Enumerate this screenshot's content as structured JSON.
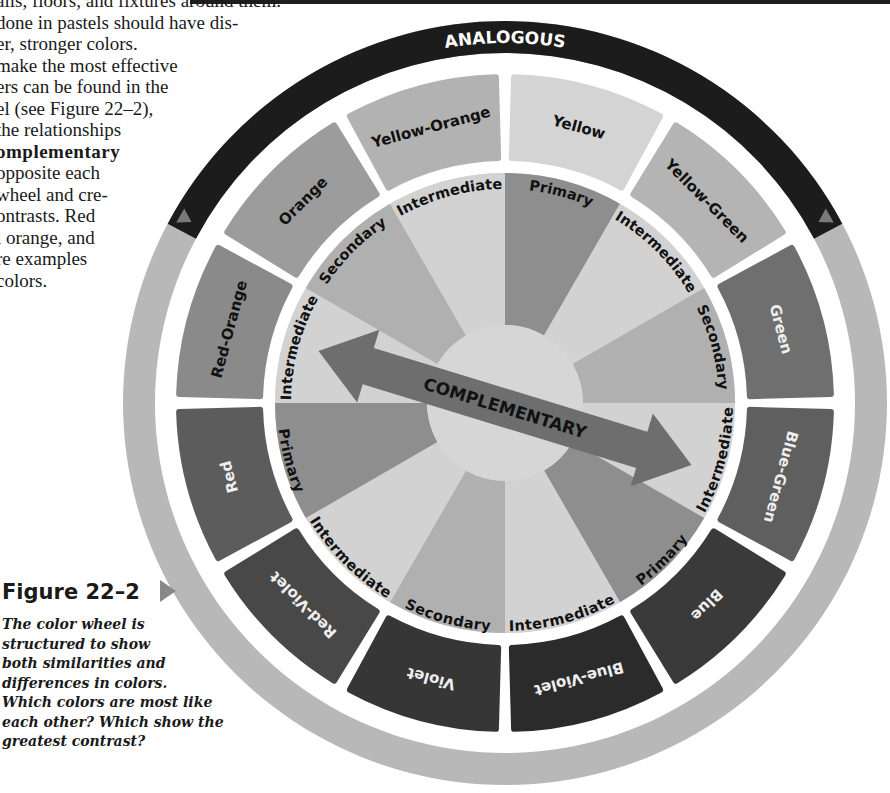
{
  "page": {
    "top_rule_color": "#1e1e1e"
  },
  "body_text": {
    "lines": [
      "alls, floors, and fixtures around them.",
      " done in pastels should have dis-",
      "er, stronger colors.",
      "make the most effective",
      "ers can be found in the",
      "el (see Figure 22–2),",
      "the relationships",
      "omplementary",
      "opposite each",
      "wheel and cre-",
      "ontrasts. Red",
      "l orange, and",
      "re examples",
      "colors."
    ],
    "bold_line_index": 7
  },
  "figure": {
    "label": "Figure 22–2",
    "caption_lines": [
      "The color wheel is",
      "structured to show",
      "both similarities and",
      "differences in colors.",
      "Which colors are most like",
      "each other? Which show the",
      "greatest contrast?"
    ],
    "footer_fragment": "     ..tion"
  },
  "wheel": {
    "center": [
      505,
      403
    ],
    "outer_band": {
      "analogous_label": "ANALOGOUS",
      "analogous_color": "#1c1c1c",
      "ring_color": "#b8b8b8",
      "marker_color": "#7a7a7a"
    },
    "complementary_label": "COMPLEMENTARY",
    "arrow_color": "#6e6e6e",
    "center_color": "#d6d6d6",
    "segments": [
      {
        "name": "Yellow",
        "fill": "#d4d4d4",
        "text": "#111111"
      },
      {
        "name": "Yellow-Green",
        "fill": "#b4b4b4",
        "text": "#111111"
      },
      {
        "name": "Green",
        "fill": "#6f6f6f",
        "text": "#eeeeee"
      },
      {
        "name": "Blue-Green",
        "fill": "#5f5f5f",
        "text": "#eeeeee"
      },
      {
        "name": "Blue",
        "fill": "#3a3a3a",
        "text": "#eeeeee"
      },
      {
        "name": "Blue-Violet",
        "fill": "#2b2b2b",
        "text": "#eeeeee"
      },
      {
        "name": "Violet",
        "fill": "#363636",
        "text": "#eeeeee"
      },
      {
        "name": "Red-Violet",
        "fill": "#484848",
        "text": "#eeeeee"
      },
      {
        "name": "Red",
        "fill": "#5c5c5c",
        "text": "#eeeeee"
      },
      {
        "name": "Red-Orange",
        "fill": "#8a8a8a",
        "text": "#111111"
      },
      {
        "name": "Orange",
        "fill": "#9c9c9c",
        "text": "#111111"
      },
      {
        "name": "Yellow-Orange",
        "fill": "#b2b2b2",
        "text": "#111111"
      }
    ],
    "inner_wedges": [
      {
        "name": "Primary",
        "fill": "#8e8e8e"
      },
      {
        "name": "Intermediate",
        "fill": "#d2d2d2"
      },
      {
        "name": "Secondary",
        "fill": "#b0b0b0"
      },
      {
        "name": "Intermediate",
        "fill": "#d2d2d2"
      },
      {
        "name": "Primary",
        "fill": "#8e8e8e"
      },
      {
        "name": "Intermediate",
        "fill": "#d2d2d2"
      },
      {
        "name": "Secondary",
        "fill": "#b0b0b0"
      },
      {
        "name": "Intermediate",
        "fill": "#d2d2d2"
      },
      {
        "name": "Primary",
        "fill": "#8e8e8e"
      },
      {
        "name": "Intermediate",
        "fill": "#d2d2d2"
      },
      {
        "name": "Secondary",
        "fill": "#b0b0b0"
      },
      {
        "name": "Intermediate",
        "fill": "#d2d2d2"
      }
    ]
  }
}
